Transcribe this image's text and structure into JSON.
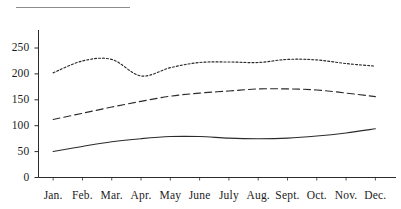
{
  "figure": {
    "title_rule": "",
    "background_color": "#ffffff",
    "ink_color": "#222222"
  },
  "chart_data": {
    "type": "line",
    "title": "",
    "subtitle": "",
    "xlabel": "",
    "ylabel": "",
    "categories": [
      "Jan.",
      "Feb.",
      "Mar.",
      "Apr.",
      "May",
      "June",
      "July",
      "Aug.",
      "Sept.",
      "Oct.",
      "Nov.",
      "Dec."
    ],
    "x_tick_labels": [
      "Jan.",
      "Feb.",
      "Mar.",
      "Apr.",
      "May",
      "June",
      "July",
      "Aug.",
      "Sept.",
      "Oct.",
      "Nov.",
      "Dec."
    ],
    "y_tick_labels": [
      "0",
      "50",
      "100",
      "150",
      "200",
      "250"
    ],
    "y_ticks": [
      0,
      50,
      100,
      150,
      200,
      250
    ],
    "ylim": [
      0,
      285
    ],
    "xlim": [
      0,
      13
    ],
    "grid": false,
    "legend": "none",
    "legend_position": "none",
    "series": [
      {
        "name": "upper-series",
        "style": "dotted",
        "color": "#2b2b2b",
        "values": [
          202,
          225,
          228,
          196,
          212,
          222,
          223,
          222,
          228,
          227,
          220,
          215
        ]
      },
      {
        "name": "middle-series",
        "style": "dashed",
        "color": "#2b2b2b",
        "values": [
          112,
          124,
          136,
          147,
          157,
          163,
          167,
          171,
          171,
          169,
          163,
          156
        ]
      },
      {
        "name": "lower-series",
        "style": "solid",
        "color": "#2b2b2b",
        "values": [
          50,
          60,
          69,
          75,
          79,
          79,
          76,
          75,
          76,
          80,
          86,
          94
        ]
      }
    ],
    "annotations": []
  },
  "axes": {
    "y_axis_name": "value-axis",
    "x_axis_name": "month-axis"
  }
}
